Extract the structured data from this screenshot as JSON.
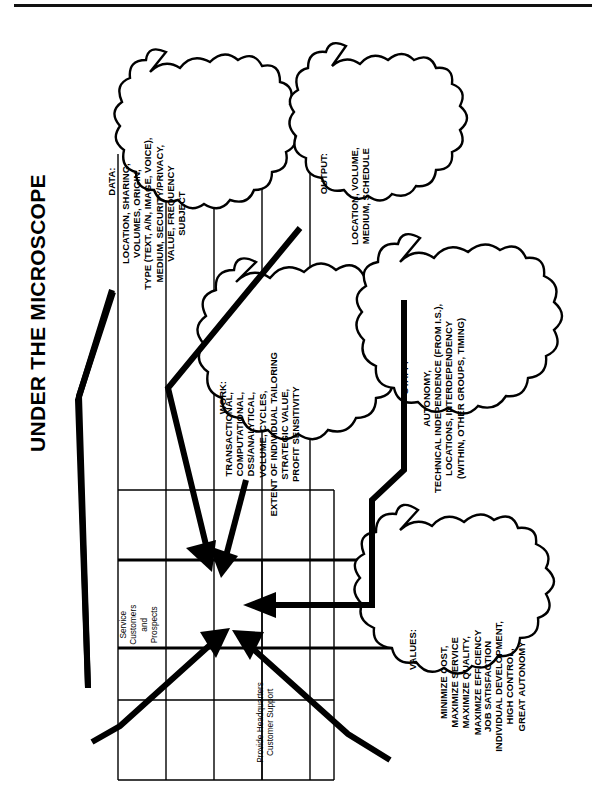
{
  "page": {
    "title": "UNDER THE MICROSCOPE",
    "orientation": "rotated-90-ccw",
    "line_color": "#000000",
    "background": "#ffffff"
  },
  "clouds": [
    {
      "id": "data",
      "heading": "DATA:",
      "body": "LOCATION, SHARING,\nVOLUMES, ORIGIN,\nTYPE (TEXT, A/N, IMAGE, VOICE),\nMEDIUM, SECURITY/PRIVACY,\nVALUE, FREQUENCY\nSUBJECT"
    },
    {
      "id": "output",
      "heading": "OUTPUT:",
      "body": "LOCATION, VOLUME,\nMEDIUM, SCHEDULE"
    },
    {
      "id": "work",
      "heading": "WORK:",
      "body": "TRANSACTIONAL,\nCOMPUTATIONAL,\nDSS/ANALYTICAL,\nVOLUME, CYCLES,\nEXTENT OF INDIVIDUAL TAILORING\nSTRATEGIC VALUE,\nPROFIT SENSITIVITY"
    },
    {
      "id": "staff",
      "heading": "STAFF:",
      "body": "AUTONOMY,\nTECHNICAL INDEPENDENCE (FROM I.S.),\nLOCATIONS, INTERDEPENDENCY\n(WITHIN, OTHER GROUPS, TIMING)"
    },
    {
      "id": "values",
      "heading": "VALUES:",
      "body": "MINIMIZE COST,\nMAXIMIZE SERVICE\nMAXIMIZE QUALITY,\nMAXIMIZE EFFICIENCY",
      "body2": "JOB SATISFACTION\nINDIVIDUAL DEVELOPMENT,\nHIGH CONTROL,\nGREAT AUTONOMY"
    }
  ],
  "matrix": {
    "cells": [
      {
        "id": "service-customers",
        "label": "Service\nCustomers\nand\nProspects"
      },
      {
        "id": "headquarters-support",
        "label": "Provide Headquarters\nCustomer Support"
      }
    ]
  },
  "arrows": [
    {
      "id": "arrow-from-data",
      "from": "data",
      "to": "matrix-focus"
    },
    {
      "id": "arrow-from-output",
      "from": "output",
      "to": "matrix-focus"
    },
    {
      "id": "arrow-from-work",
      "from": "work",
      "to": "matrix-focus"
    },
    {
      "id": "arrow-from-staff",
      "from": "staff",
      "to": "matrix-focus"
    },
    {
      "id": "arrow-from-values",
      "from": "values",
      "to": "matrix-focus"
    }
  ]
}
